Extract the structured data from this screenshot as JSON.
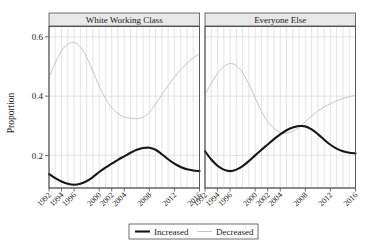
{
  "chart_data": {
    "type": "line",
    "title": "",
    "xlabel": "",
    "ylabel": "Proportion",
    "xlim": [
      1992,
      2016
    ],
    "ylim": [
      0.09,
      0.635
    ],
    "yticks": [
      0.2,
      0.4,
      0.6
    ],
    "ytick_labels": [
      "0.2",
      "0.4",
      "0.6"
    ],
    "xticks": [
      1992,
      1994,
      1996,
      2000,
      2002,
      2004,
      2008,
      2012,
      2016
    ],
    "xtick_labels": [
      "1992",
      "1994",
      "1996",
      "2000",
      "2002",
      "2004",
      "2008",
      "2012",
      "2016"
    ],
    "grid": true,
    "grid_vertical_years": [
      1992,
      1993,
      1994,
      1995,
      1996,
      1997,
      1998,
      1999,
      2000,
      2001,
      2002,
      2003,
      2004,
      2005,
      2006,
      2007,
      2008,
      2009,
      2010,
      2011,
      2012,
      2013,
      2014,
      2015,
      2016
    ],
    "legend_position": "bottom",
    "legend_entries": [
      {
        "name": "Increased",
        "color": "#161616",
        "width": "thick"
      },
      {
        "name": "Decreased",
        "color": "#c5c5c5",
        "width": "thin"
      }
    ],
    "panels": [
      {
        "label": "White Working Class",
        "series": [
          {
            "name": "Increased",
            "color": "#161616",
            "x": [
              1992,
              1993,
              1994,
              1995,
              1996,
              1997,
              1998,
              1999,
              2000,
              2001,
              2002,
              2003,
              2004,
              2005,
              2006,
              2007,
              2008,
              2009,
              2010,
              2011,
              2012,
              2013,
              2014,
              2015,
              2016
            ],
            "values": [
              0.137,
              0.123,
              0.112,
              0.104,
              0.101,
              0.104,
              0.113,
              0.127,
              0.144,
              0.159,
              0.172,
              0.185,
              0.197,
              0.209,
              0.219,
              0.225,
              0.226,
              0.219,
              0.204,
              0.187,
              0.172,
              0.161,
              0.153,
              0.149,
              0.147
            ]
          },
          {
            "name": "Decreased",
            "color": "#c5c5c5",
            "x": [
              1992,
              1993,
              1994,
              1995,
              1996,
              1997,
              1998,
              1999,
              2000,
              2001,
              2002,
              2003,
              2004,
              2005,
              2006,
              2007,
              2008,
              2009,
              2010,
              2011,
              2012,
              2013,
              2014,
              2015,
              2016
            ],
            "values": [
              0.463,
              0.512,
              0.553,
              0.576,
              0.581,
              0.566,
              0.531,
              0.483,
              0.434,
              0.392,
              0.361,
              0.341,
              0.33,
              0.325,
              0.324,
              0.329,
              0.345,
              0.373,
              0.405,
              0.436,
              0.464,
              0.489,
              0.511,
              0.529,
              0.543
            ]
          }
        ]
      },
      {
        "label": "Everyone Else",
        "series": [
          {
            "name": "Increased",
            "color": "#161616",
            "x": [
              1992,
              1993,
              1994,
              1995,
              1996,
              1997,
              1998,
              1999,
              2000,
              2001,
              2002,
              2003,
              2004,
              2005,
              2006,
              2007,
              2008,
              2009,
              2010,
              2011,
              2012,
              2013,
              2014,
              2015,
              2016
            ],
            "values": [
              0.214,
              0.186,
              0.165,
              0.152,
              0.147,
              0.152,
              0.164,
              0.181,
              0.2,
              0.219,
              0.237,
              0.255,
              0.271,
              0.285,
              0.294,
              0.299,
              0.298,
              0.288,
              0.272,
              0.253,
              0.236,
              0.223,
              0.214,
              0.209,
              0.207
            ]
          },
          {
            "name": "Decreased",
            "color": "#c5c5c5",
            "x": [
              1992,
              1993,
              1994,
              1995,
              1996,
              1997,
              1998,
              1999,
              2000,
              2001,
              2002,
              2003,
              2004,
              2005,
              2006,
              2007,
              2008,
              2009,
              2010,
              2011,
              2012,
              2013,
              2014,
              2015,
              2016
            ],
            "values": [
              0.405,
              0.444,
              0.477,
              0.5,
              0.51,
              0.503,
              0.479,
              0.44,
              0.394,
              0.349,
              0.314,
              0.291,
              0.278,
              0.275,
              0.281,
              0.295,
              0.314,
              0.333,
              0.35,
              0.364,
              0.375,
              0.384,
              0.392,
              0.398,
              0.403
            ]
          }
        ]
      }
    ]
  }
}
